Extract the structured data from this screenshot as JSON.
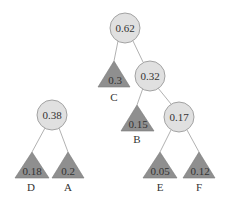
{
  "diagram": {
    "type": "huffman-forest",
    "colors": {
      "internal_fill": "#e0e0e0",
      "internal_stroke": "#9a9a9a",
      "leaf_fill": "#8f8f8f",
      "edge": "#a8a8a8",
      "text": "#333333"
    },
    "trees": [
      {
        "root": {
          "value": "0.38",
          "children": [
            {
              "leaf": true,
              "value": "0.18",
              "label": "D"
            },
            {
              "leaf": true,
              "value": "0.2",
              "label": "A"
            }
          ]
        }
      },
      {
        "root": {
          "value": "0.62",
          "children": [
            {
              "leaf": true,
              "value": "0.3",
              "label": "C"
            },
            {
              "value": "0.32",
              "children": [
                {
                  "leaf": true,
                  "value": "0.15",
                  "label": "B"
                },
                {
                  "value": "0.17",
                  "children": [
                    {
                      "leaf": true,
                      "value": "0.05",
                      "label": "E"
                    },
                    {
                      "leaf": true,
                      "value": "0.12",
                      "label": "F"
                    }
                  ]
                }
              ]
            }
          ]
        }
      }
    ],
    "nodes": {
      "n062": "0.62",
      "n032": "0.32",
      "n017": "0.17",
      "n038": "0.38"
    },
    "leaves": {
      "C": {
        "value": "0.3",
        "label": "C"
      },
      "B": {
        "value": "0.15",
        "label": "B"
      },
      "E": {
        "value": "0.05",
        "label": "E"
      },
      "F": {
        "value": "0.12",
        "label": "F"
      },
      "D": {
        "value": "0.18",
        "label": "D"
      },
      "A": {
        "value": "0.2",
        "label": "A"
      }
    }
  }
}
